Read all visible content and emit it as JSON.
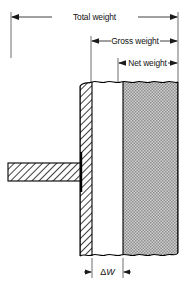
{
  "diagram": {
    "type": "engineering-cross-section",
    "canvas": {
      "width": 189,
      "height": 288,
      "background": "#ffffff"
    },
    "dimensions": [
      {
        "id": "total-weight",
        "label": "Total weight",
        "y": 17,
        "x_start": 11,
        "x_end": 178,
        "arrow_direction": "both-outward",
        "label_position": "center"
      },
      {
        "id": "gross-weight",
        "label": "Gross weight",
        "y": 41,
        "x_start": 91,
        "x_end": 178,
        "arrow_direction": "both-outward",
        "label_position": "center"
      },
      {
        "id": "net-weight",
        "label": "Net weight",
        "y": 63,
        "x_start": 118,
        "x_end": 178,
        "arrow_direction": "both-outward",
        "label_position": "center"
      },
      {
        "id": "delta-w",
        "label": "ΔW",
        "label_symbol": "Δ",
        "label_variable": "W",
        "y": 272,
        "x_start": 92,
        "x_end": 123,
        "arrow_direction": "both-outward",
        "label_position": "center"
      }
    ],
    "parts": [
      {
        "id": "container-wall",
        "name": "container-wall",
        "fill": "hatch-45",
        "x": 80,
        "y": 82,
        "width": 12,
        "height": 174
      },
      {
        "id": "headspace",
        "name": "headspace-void",
        "fill": "white",
        "x": 92,
        "y": 82,
        "width": 31,
        "height": 174
      },
      {
        "id": "net-contents",
        "name": "net-contents",
        "fill": "stipple-gray",
        "x": 123,
        "y": 82,
        "width": 55,
        "height": 174
      },
      {
        "id": "stem",
        "name": "support-stem",
        "fill": "hatch-45",
        "x": 8,
        "y": 163,
        "width": 72,
        "height": 18
      },
      {
        "id": "seal",
        "name": "seal-marker",
        "fill": "solid-black",
        "x": 80,
        "y": 152,
        "width": 2,
        "height": 40
      }
    ],
    "colors": {
      "line": "#000000",
      "dimension_line": "#2a2a2a",
      "extension_line": "#4a4a4a",
      "stipple_fill": "#b4b4b4",
      "hatch_fill": "#ffffff",
      "background": "#ffffff"
    }
  }
}
